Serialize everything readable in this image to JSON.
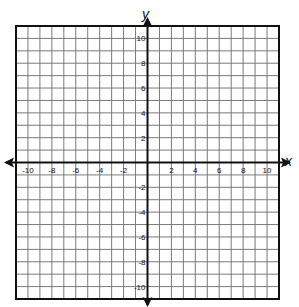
{
  "chart_data": {
    "type": "coordinate-plane",
    "title": "",
    "xlabel": "x",
    "ylabel": "y",
    "xlim": [
      -11,
      11
    ],
    "ylim": [
      -11,
      11
    ],
    "grid": true,
    "grid_step": 1,
    "x_ticks": [
      -10,
      -8,
      -6,
      -4,
      -2,
      2,
      4,
      6,
      8,
      10
    ],
    "y_ticks": [
      10,
      8,
      6,
      4,
      2,
      -2,
      -4,
      -6,
      -8,
      -10
    ],
    "x_tick_labels": [
      "-10",
      "-8",
      "-6",
      "-4",
      "-2",
      "2",
      "4",
      "6",
      "8",
      "10"
    ],
    "y_tick_labels": [
      "10",
      "8",
      "6",
      "4",
      "2",
      "-2",
      "-4",
      "-6",
      "-8",
      "-10"
    ],
    "arrows": {
      "x_axis": "both",
      "y_axis": "both"
    },
    "series": []
  },
  "axes": {
    "x_label": "x",
    "y_label": "y"
  },
  "colors": {
    "grid": "#7a7a7a",
    "border": "#111111",
    "axis": "#111111",
    "background": "#ffffff"
  }
}
